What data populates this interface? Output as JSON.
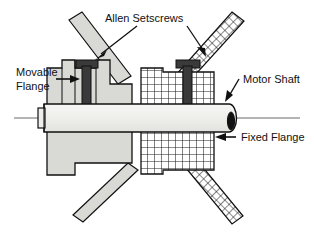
{
  "figure": {
    "type": "technical-diagram",
    "background_color": "#ffffff",
    "line_color": "#111111"
  },
  "labels": {
    "allen_setscrews": "Allen  Setscrews",
    "movable_flange_line1": "Movable",
    "movable_flange_line2": "Flange",
    "motor_shaft": "Motor  Shaft",
    "fixed_flange": "Fixed  Flange"
  },
  "parts": {
    "movable_flange": {
      "name": "Movable Flange",
      "fill": "#d9d9d6",
      "hatch": "solid-gray"
    },
    "fixed_flange": {
      "name": "Fixed Flange",
      "fill": "#ffffff",
      "hatch": "cross-hatch"
    },
    "motor_shaft": {
      "name": "Motor Shaft",
      "fill": "#eeeeec",
      "hatch": "none"
    },
    "setscrew_left": {
      "name": "Allen Setscrew (left)",
      "fill": "#3a3a3a"
    },
    "setscrew_right": {
      "name": "Allen Setscrew (right)",
      "fill": "#3a3a3a"
    },
    "arm_upper_left": {
      "name": "Upper left arm",
      "fill": "#d9d9d6"
    },
    "arm_lower_left": {
      "name": "Lower left arm",
      "fill": "#d9d9d6"
    },
    "arm_upper_right": {
      "name": "Upper right arm",
      "hatch": "cross-hatch"
    },
    "arm_lower_right": {
      "name": "Lower right arm",
      "hatch": "cross-hatch"
    }
  },
  "annotations": [
    {
      "name": "allen-setscrews-leader-left",
      "target": "setscrew_left"
    },
    {
      "name": "allen-setscrews-leader-right",
      "target": "setscrew_right"
    },
    {
      "name": "movable-flange-arrow",
      "target": "movable_flange"
    },
    {
      "name": "motor-shaft-arrow",
      "target": "motor_shaft"
    },
    {
      "name": "fixed-flange-arrow",
      "target": "fixed_flange"
    }
  ]
}
